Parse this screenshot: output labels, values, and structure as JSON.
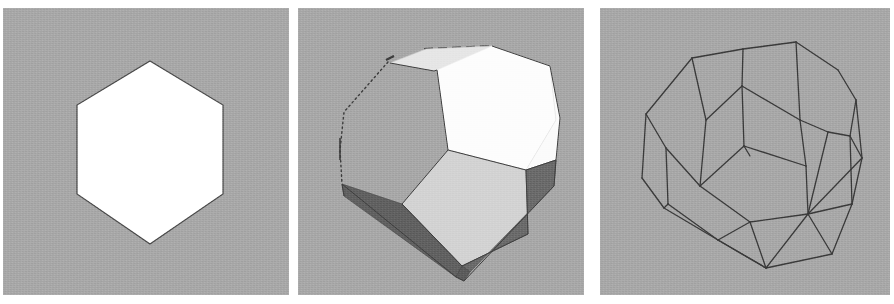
{
  "figure": {
    "title": "Three renderings of a truncated octahedron",
    "panel_count": 3,
    "background_color": "#ffffff",
    "plate_color": "#a8a8a8",
    "media": "scanned halftone figure"
  },
  "panels": [
    {
      "id": "panel-silhouette",
      "name": "silhouette-hexagon",
      "label": "",
      "render_mode": "silhouette",
      "plate": {
        "x": 3,
        "y": 8,
        "width": 286,
        "height": 287,
        "fill": "#a8a8a8"
      },
      "shape": {
        "name": "regular-hexagon",
        "fill": "#ffffff",
        "stroke": "#4a4a4a",
        "stroke_width": 1.2,
        "points": "147,53 220,97 220,186 147,236 74,186 74,97",
        "vertex_count": 6,
        "center": [
          147,
          145
        ],
        "width_px": 146,
        "height_px": 183
      }
    },
    {
      "id": "panel-shaded",
      "name": "shaded-solid",
      "label": "",
      "render_mode": "flat-shaded-solid",
      "plate": {
        "x": 298,
        "y": 8,
        "width": 286,
        "height": 287,
        "fill": "#a8a8a8"
      },
      "silhouette_hidden_stroke": "#3c3c3c",
      "faces": [
        {
          "name": "top-back-face",
          "fill": "#e4e4e4",
          "points": "90,54 130,40 196,38 186,52 130,62"
        },
        {
          "name": "top-right-face",
          "fill": "#fdfdfd",
          "points": "196,38 250,56 256,108 228,160 148,140 140,60"
        },
        {
          "name": "right-upper-face",
          "fill": "#fcfcfc",
          "points": "250,56 256,108 228,160 256,160 262,110"
        },
        {
          "name": "front-center-face",
          "fill": "#d2d2d2",
          "points": "148,140 228,160 230,228 162,258 106,196"
        },
        {
          "name": "front-left-dark",
          "fill": "#5e5e5e",
          "points": "44,176 106,196 162,258 152,268 48,186"
        },
        {
          "name": "front-right-dark",
          "fill": "#6a6a6a",
          "points": "228,160 262,150 256,176 172,262 162,258"
        },
        {
          "name": "bottom-dark-face",
          "fill": "#666666",
          "points": "152,268 162,258 172,262 166,272"
        }
      ],
      "hidden_edges": [
        {
          "name": "upper-left-silhouette",
          "points": "90,54 46,100 42,140 44,176",
          "dash": "2,3"
        },
        {
          "name": "top-back-edge",
          "points": "130,40 196,38",
          "dash": "6,4"
        },
        {
          "name": "left-tick",
          "points": "42,132 42,152",
          "dash": "0"
        }
      ]
    },
    {
      "id": "panel-wireframe",
      "name": "wireframe",
      "label": "",
      "render_mode": "wireframe",
      "plate": {
        "x": 600,
        "y": 8,
        "width": 290,
        "height": 287,
        "fill": "#a8a8a8"
      },
      "stroke": "#3a3a3a",
      "stroke_width": 1.3,
      "vertex_count": 24,
      "edge_count": 36,
      "face_count": 14,
      "solid_name": "truncated octahedron",
      "vertices": [
        {
          "id": "v1",
          "x": 143,
          "y": 41
        },
        {
          "id": "v2",
          "x": 195,
          "y": 34
        },
        {
          "id": "v3",
          "x": 90,
          "y": 50
        },
        {
          "id": "v4",
          "x": 46,
          "y": 105
        },
        {
          "id": "v5",
          "x": 42,
          "y": 170
        },
        {
          "id": "v6",
          "x": 63,
          "y": 200
        },
        {
          "id": "v7",
          "x": 66,
          "y": 140
        },
        {
          "id": "v8",
          "x": 118,
          "y": 232
        },
        {
          "id": "v9",
          "x": 166,
          "y": 258
        },
        {
          "id": "v10",
          "x": 232,
          "y": 246
        },
        {
          "id": "v11",
          "x": 252,
          "y": 196
        },
        {
          "id": "v12",
          "x": 262,
          "y": 150
        },
        {
          "id": "v13",
          "x": 254,
          "y": 90
        },
        {
          "id": "v14",
          "x": 236,
          "y": 62
        },
        {
          "id": "v15",
          "x": 142,
          "y": 78
        },
        {
          "id": "v16",
          "x": 144,
          "y": 138
        },
        {
          "id": "v17",
          "x": 106,
          "y": 112
        },
        {
          "id": "v18",
          "x": 100,
          "y": 178
        },
        {
          "id": "v19",
          "x": 200,
          "y": 112
        },
        {
          "id": "v20",
          "x": 206,
          "y": 158
        },
        {
          "id": "v21",
          "x": 150,
          "y": 214
        },
        {
          "id": "v22",
          "x": 208,
          "y": 206
        },
        {
          "id": "v23",
          "x": 228,
          "y": 124
        },
        {
          "id": "v24",
          "x": 250,
          "y": 128
        }
      ]
    }
  ]
}
